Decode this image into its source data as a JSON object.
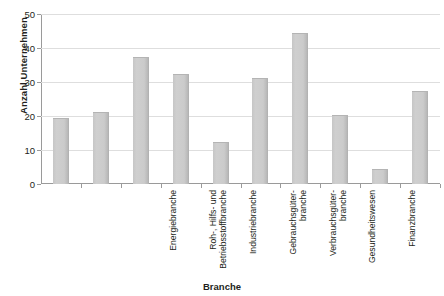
{
  "chart_data": {
    "type": "bar",
    "title": "",
    "xlabel": "Branche",
    "ylabel": "Anzahl Unternehmen",
    "ylim": [
      0,
      50
    ],
    "yticks": [
      0,
      10,
      20,
      30,
      40,
      50
    ],
    "grid": true,
    "legend": "none",
    "bar_color": "#cccccc",
    "categories": [
      "Energiebranche",
      "Roh-, Hilfs- und\nBetriebsstoffbranche",
      "Industriebranche",
      "Gebrauchsgüter-\nbranche",
      "Verbrauchsgüter-\nbranche",
      "Gesundheitswesen",
      "Finanzbranche",
      "Informations-\ntechnologiebranche",
      "Telekommu-\nnikationsdienste",
      "Versorgungswesen"
    ],
    "values": [
      19,
      21,
      37,
      32,
      12,
      31,
      44,
      20,
      4,
      27
    ]
  }
}
